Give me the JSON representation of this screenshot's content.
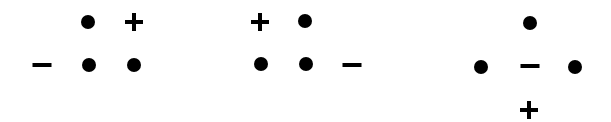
{
  "figure": {
    "colors": {
      "background": "#ffffff",
      "ink": "#000000"
    },
    "panels": [
      {
        "name": "panel-1",
        "items": [
          {
            "type": "dot",
            "x": 88,
            "y": 22
          },
          {
            "type": "plus",
            "x": 134,
            "y": 22
          },
          {
            "type": "minus",
            "x": 42,
            "y": 65
          },
          {
            "type": "dot",
            "x": 89,
            "y": 65
          },
          {
            "type": "dot",
            "x": 134,
            "y": 65
          }
        ]
      },
      {
        "name": "panel-2",
        "items": [
          {
            "type": "plus",
            "x": 260,
            "y": 22
          },
          {
            "type": "dot",
            "x": 305,
            "y": 21
          },
          {
            "type": "dot",
            "x": 261,
            "y": 64
          },
          {
            "type": "dot",
            "x": 306,
            "y": 64
          },
          {
            "type": "minus",
            "x": 352,
            "y": 65
          }
        ]
      },
      {
        "name": "panel-3",
        "items": [
          {
            "type": "dot",
            "x": 530,
            "y": 23
          },
          {
            "type": "dot",
            "x": 481,
            "y": 67
          },
          {
            "type": "minus",
            "x": 530,
            "y": 66
          },
          {
            "type": "dot",
            "x": 575,
            "y": 67
          },
          {
            "type": "plus",
            "x": 529,
            "y": 110
          }
        ]
      }
    ]
  }
}
